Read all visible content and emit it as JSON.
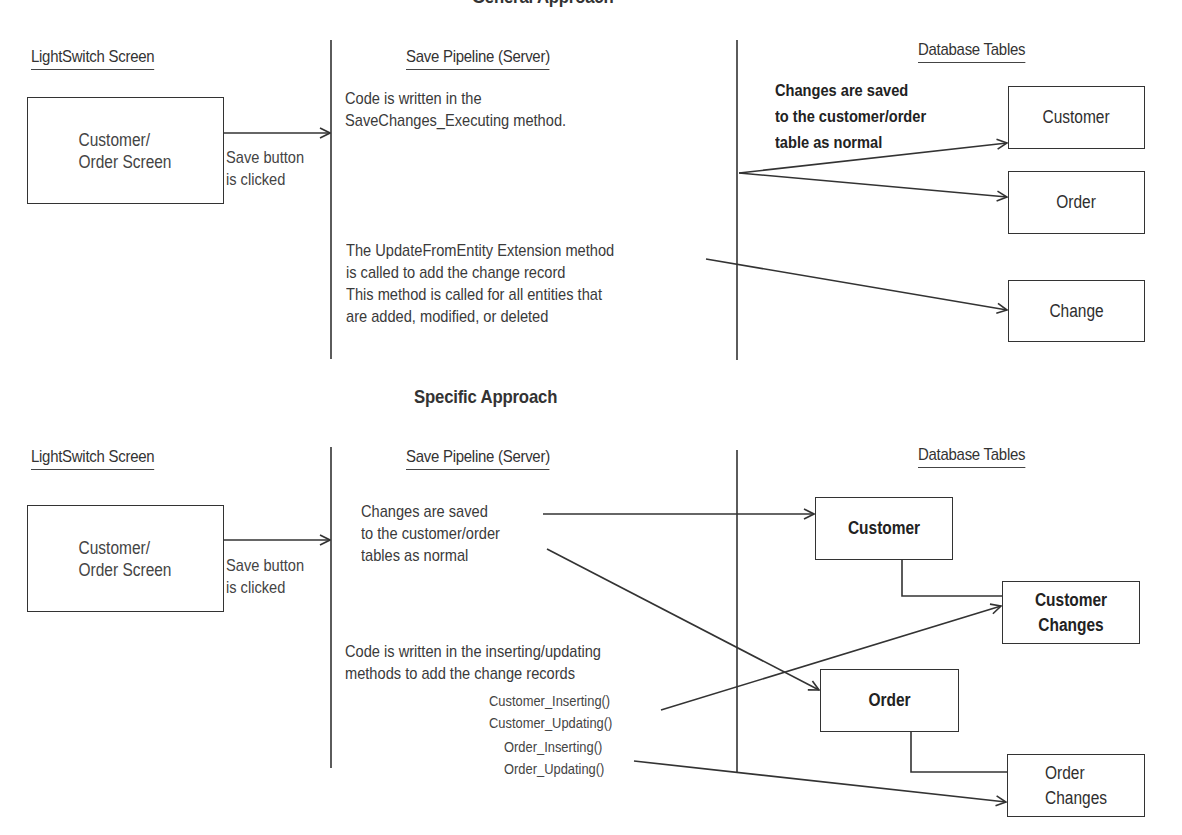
{
  "top": {
    "title": "General Approach",
    "headers": {
      "screen": "LightSwitch Screen",
      "pipeline": "Save Pipeline (Server)",
      "tables": "Database Tables"
    },
    "screen_box": {
      "line1": "Customer/",
      "line2": "Order Screen"
    },
    "save_note": {
      "line1": "Save button",
      "line2": "is clicked"
    },
    "pipeline_note_1": {
      "line1": "Code is written in the",
      "line2": "SaveChanges_Executing method."
    },
    "pipeline_note_2": {
      "line1": "The UpdateFromEntity Extension method",
      "line2": "is called to add the change record",
      "line3": "This method is called for all entities that",
      "line4": "are added, modified, or deleted"
    },
    "tables_note": {
      "line1": "Changes are saved",
      "line2": "to the customer/order",
      "line3": "table as normal"
    },
    "tables": [
      {
        "label": "Customer"
      },
      {
        "label": "Order"
      },
      {
        "label": "Change"
      }
    ]
  },
  "bottom": {
    "title": "Specific Approach",
    "headers": {
      "screen": "LightSwitch Screen",
      "pipeline": "Save Pipeline (Server)",
      "tables": "Database Tables"
    },
    "screen_box": {
      "line1": "Customer/",
      "line2": "Order Screen"
    },
    "save_note": {
      "line1": "Save button",
      "line2": "is clicked"
    },
    "pipeline_note_1": {
      "line1": "Changes are saved",
      "line2": "to the customer/order",
      "line3": "tables as normal"
    },
    "pipeline_note_2": {
      "line1": "Code is written in the inserting/updating",
      "line2": "methods to add the change records"
    },
    "methods": [
      "Customer_Inserting()",
      "Customer_Updating()",
      "Order_Inserting()",
      "Order_Updating()"
    ],
    "tables": [
      {
        "label": "Customer"
      },
      {
        "label1": "Customer",
        "label2": "Changes"
      },
      {
        "label": "Order"
      },
      {
        "label1": "Order",
        "label2": "Changes"
      }
    ]
  },
  "colors": {
    "ink": "#333333",
    "background": "#ffffff"
  }
}
